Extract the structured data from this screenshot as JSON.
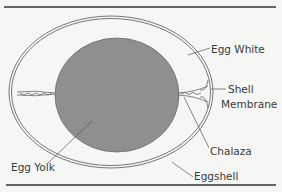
{
  "figure": {
    "labels": {
      "egg_white": "Egg White",
      "shell_line1": "Shell",
      "shell_line2": "Membrane",
      "chalaza": "Chalaza",
      "egg_yolk": "Egg Yolk",
      "eggshell": "Eggshell"
    },
    "colors": {
      "background": "#f6f6f4",
      "yolk": "#8f8f8f",
      "line": "#555555",
      "rule": "#333333"
    }
  }
}
